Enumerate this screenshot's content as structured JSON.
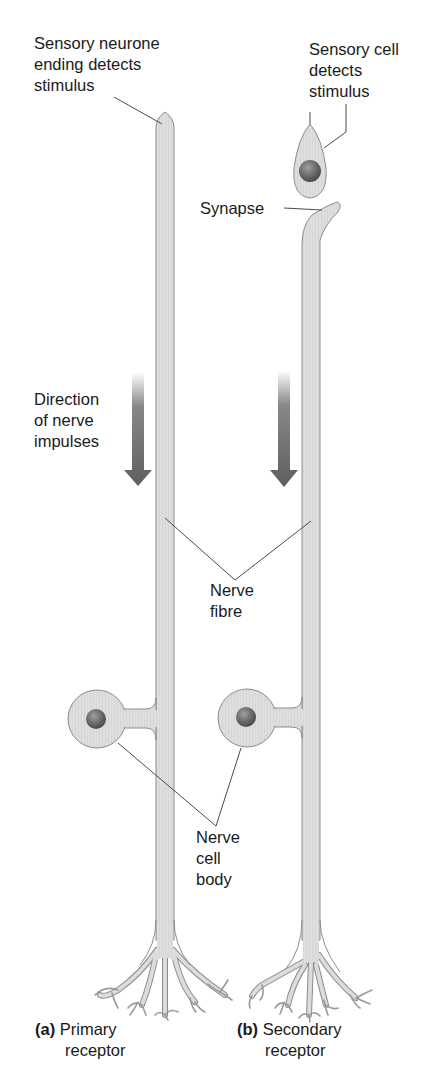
{
  "diagram": {
    "colors": {
      "fibre_fill": "#dcdcdc",
      "fibre_stroke": "#8c8c8c",
      "nucleus": "#6e6e6e",
      "arrow": "#6a6a6a",
      "leader": "#4a4a4a",
      "text": "#1a1a1a"
    },
    "labels": {
      "sensory_neurone": "Sensory neurone\nending detects\nstimulus",
      "sensory_cell": "Sensory cell\ndetects\nstimulus",
      "synapse": "Synapse",
      "direction": "Direction\nof nerve\nimpulses",
      "nerve_fibre": "Nerve\nfibre",
      "nerve_cell_body": "Nerve\ncell\nbody"
    },
    "panels": [
      {
        "letter": "(a)",
        "title": "Primary",
        "subtitle": "receptor"
      },
      {
        "letter": "(b)",
        "title": "Secondary",
        "subtitle": "receptor"
      }
    ]
  }
}
